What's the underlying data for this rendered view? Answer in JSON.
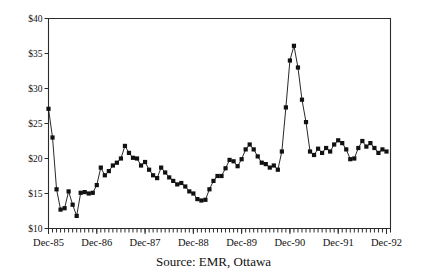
{
  "caption": "Source: EMR, Ottawa",
  "chart_data": {
    "type": "line",
    "title": "",
    "subtitle": "",
    "xlabel": "",
    "ylabel": "",
    "grid": false,
    "legend": "none",
    "marker": "filled-square",
    "ylim": [
      10,
      40
    ],
    "ytick_values": [
      10,
      15,
      20,
      25,
      30,
      35,
      40
    ],
    "ytick_labels": [
      "$10",
      "$15",
      "$20",
      "$25",
      "$30",
      "$35",
      "$40"
    ],
    "xtick_labels": [
      "Dec-85",
      "Dec-86",
      "Dec-87",
      "Dec-88",
      "Dec-89",
      "Dec-90",
      "Dec-91",
      "Dec-92"
    ],
    "xtick_values": [
      0,
      12,
      24,
      36,
      48,
      60,
      72,
      84
    ],
    "minor_xticks": "monthly",
    "x_range": [
      0,
      85
    ],
    "series": [
      {
        "name": "Price",
        "values": [
          27.1,
          23.0,
          15.6,
          12.7,
          12.9,
          15.3,
          13.4,
          11.8,
          15.1,
          15.2,
          15.0,
          15.1,
          16.2,
          18.7,
          17.6,
          18.2,
          19.0,
          19.4,
          20.0,
          21.8,
          20.8,
          20.1,
          20.0,
          19.0,
          19.5,
          18.4,
          17.6,
          17.2,
          18.7,
          18.0,
          17.3,
          16.8,
          16.3,
          16.5,
          16.0,
          15.3,
          15.0,
          14.2,
          14.0,
          14.1,
          15.6,
          16.8,
          17.5,
          17.5,
          18.6,
          19.8,
          19.6,
          18.9,
          19.9,
          21.3,
          22.0,
          21.3,
          20.3,
          19.4,
          19.2,
          18.7,
          19.0,
          18.4,
          21.0,
          27.3,
          34.0,
          36.1,
          33.0,
          28.4,
          25.2,
          21.0,
          20.5,
          21.4,
          20.8,
          21.5,
          21.0,
          22.0,
          22.6,
          22.2,
          21.3,
          19.9,
          20.0,
          21.5,
          22.5,
          21.7,
          22.2,
          21.5,
          20.8,
          21.3,
          21.0
        ]
      }
    ]
  },
  "axes": {
    "y_axis_name": "price-axis",
    "x_axis_name": "date-axis"
  }
}
